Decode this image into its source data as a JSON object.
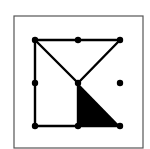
{
  "figure": {
    "frame": {
      "x": 14,
      "y": 16,
      "w": 129,
      "h": 132,
      "stroke": "#555555"
    },
    "colors": {
      "line": "#000000",
      "fill": "#000000",
      "background": "#ffffff"
    },
    "points": [
      {
        "id": "TL",
        "x": 35,
        "y": 40
      },
      {
        "id": "TM",
        "x": 78,
        "y": 40
      },
      {
        "id": "TR",
        "x": 120,
        "y": 40
      },
      {
        "id": "ML",
        "x": 35,
        "y": 83
      },
      {
        "id": "C",
        "x": 78,
        "y": 83
      },
      {
        "id": "MR",
        "x": 120,
        "y": 83
      },
      {
        "id": "BL",
        "x": 35,
        "y": 126
      },
      {
        "id": "BM",
        "x": 78,
        "y": 126
      },
      {
        "id": "BR",
        "x": 120,
        "y": 126
      }
    ],
    "segments": [
      [
        "TL",
        "TR"
      ],
      [
        "TL",
        "BL"
      ],
      [
        "BL",
        "BR"
      ],
      [
        "TL",
        "C"
      ],
      [
        "TR",
        "C"
      ],
      [
        "C",
        "BM"
      ]
    ],
    "filled_triangle": [
      "C",
      "BM",
      "BR"
    ]
  }
}
